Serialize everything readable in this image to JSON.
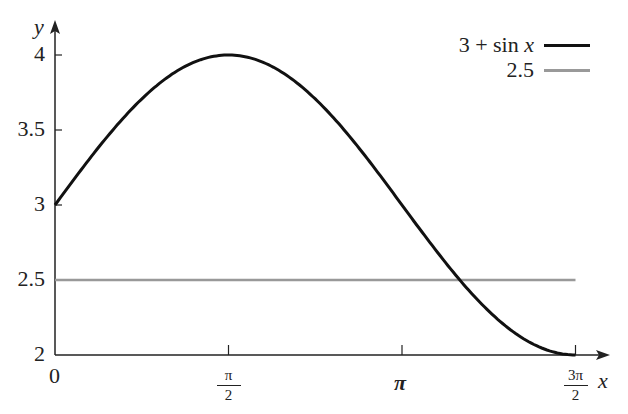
{
  "chart_data": {
    "type": "line",
    "title": "",
    "xlabel": "x",
    "ylabel": "y",
    "xlim": [
      0,
      4.712
    ],
    "ylim": [
      2,
      4.1
    ],
    "grid": false,
    "legend_position": "top-right",
    "x_ticks": [
      {
        "value": 0,
        "label": "0"
      },
      {
        "value": 1.5708,
        "label": "π/2",
        "num": "π",
        "den": "2"
      },
      {
        "value": 3.1416,
        "label": "π"
      },
      {
        "value": 4.7124,
        "label": "3π/2",
        "num": "3π",
        "den": "2"
      }
    ],
    "y_ticks": [
      {
        "value": 2,
        "label": "2"
      },
      {
        "value": 2.5,
        "label": "2.5"
      },
      {
        "value": 3,
        "label": "3"
      },
      {
        "value": 3.5,
        "label": "3.5"
      },
      {
        "value": 4,
        "label": "4"
      }
    ],
    "series": [
      {
        "name": "3 + sin x",
        "color": "#111111",
        "function": "3 + sin(x)",
        "x": [
          0,
          0.785,
          1.571,
          2.356,
          3.142,
          3.927,
          4.712
        ],
        "y": [
          3,
          3.707,
          4,
          3.707,
          3,
          2.293,
          2
        ]
      },
      {
        "name": "2.5",
        "color": "#999999",
        "function": "2.5",
        "x": [
          0,
          4.712
        ],
        "y": [
          2.5,
          2.5
        ]
      }
    ]
  },
  "legend": [
    {
      "label": "3 + sin ",
      "var": "x",
      "color": "#111111"
    },
    {
      "label": "2.5",
      "var": "",
      "color": "#999999"
    }
  ],
  "axes": {
    "x_label": "x",
    "y_label": "y",
    "origin_label": "0"
  }
}
